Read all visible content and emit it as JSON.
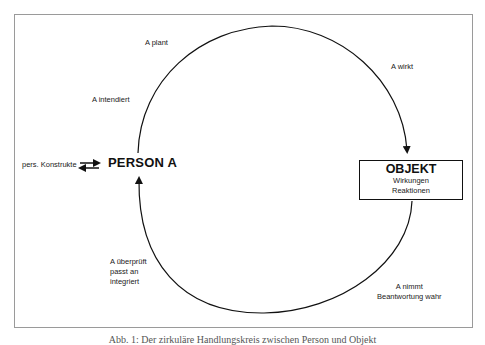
{
  "diagram": {
    "type": "circular action cycle",
    "nodes": {
      "person": "PERSON A",
      "object": {
        "title": "OBJEKT",
        "lines": [
          "Wirkungen",
          "Reaktionen"
        ]
      },
      "constructs": "pers. Konstrukte"
    },
    "edge_labels": {
      "plans": "A plant",
      "intends": "A intendiert",
      "acts": "A wirkt",
      "perceives": [
        "A nimmt",
        "Beantwortung wahr"
      ],
      "checks": [
        "A überprüft",
        "passt an",
        "integriert"
      ]
    },
    "caption": "Abb. 1: Der zirkuläre Handlungskreis zwischen Person und Objekt"
  }
}
